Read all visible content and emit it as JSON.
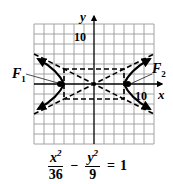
{
  "figure": {
    "type": "hyperbola-graph",
    "x_axis_label": "x",
    "y_axis_label": "y",
    "x_tick_label": "10",
    "y_tick_label": "10",
    "grid": {
      "x_min": -12,
      "x_max": 12,
      "y_min": -12,
      "y_max": 12,
      "step": 2
    },
    "foci": [
      {
        "label": "F",
        "subscript": "1",
        "x": -6.7,
        "y": 0
      },
      {
        "label": "F",
        "subscript": "2",
        "x": 6.7,
        "y": 0
      }
    ],
    "center": {
      "x": 0,
      "y": 0
    },
    "a": 6,
    "b": 3,
    "asymptotes": [
      "y = x/2",
      "y = -x/2"
    ],
    "fundamental_rectangle": {
      "x": [
        -6,
        6
      ],
      "y": [
        -3,
        3
      ]
    },
    "colors": {
      "ink": "#000000",
      "grid": "#9a9a9a",
      "background": "#ffffff"
    }
  },
  "equation": {
    "term1_numerator_var": "x",
    "term1_numerator_exp": "2",
    "term1_denominator": "36",
    "operator": "−",
    "term2_numerator_var": "y",
    "term2_numerator_exp": "2",
    "term2_denominator": "9",
    "equals": "=",
    "rhs": "1"
  }
}
